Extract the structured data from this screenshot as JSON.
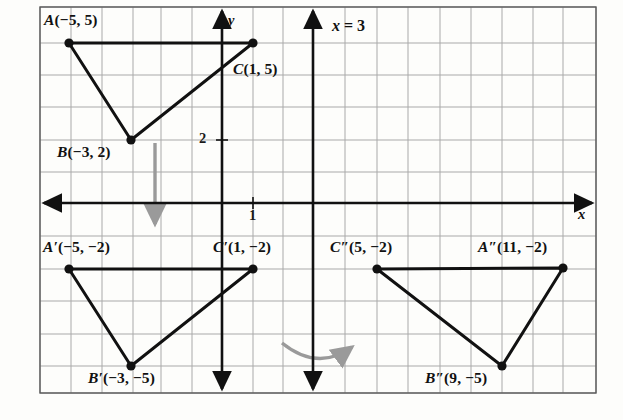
{
  "figure": {
    "grid": {
      "left": 40,
      "top": 7,
      "right": 596,
      "bottom": 393,
      "cell_width": 30.9,
      "cell_height": 32.2,
      "minor_color": "#a9a9a9",
      "border_color": "#4a4a4a"
    },
    "axes": {
      "origin_x": 222,
      "origin_y": 203,
      "x_axis_label": "x",
      "y_axis_label": "y",
      "axis_color": "#111111",
      "y_tick_label": "2",
      "x_tick_label": "1"
    },
    "mirror_line": {
      "label_text": "x = 3",
      "label_var": "x",
      "label_rest": " = 3",
      "x_value": 3
    },
    "shape_color": "#111111",
    "arrow_color": "#9a9a9a"
  },
  "points": [
    {
      "name": "A",
      "label_var": "A",
      "label_coords": "(−5, 5)",
      "x": -5,
      "y": 5,
      "px": 69,
      "py": 43,
      "label_left": 44,
      "label_top": 11,
      "triangle": "pre-image"
    },
    {
      "name": "B",
      "label_var": "B",
      "label_coords": "(−3, 2)",
      "x": -3,
      "y": 2,
      "px": 131,
      "py": 140,
      "label_left": 57,
      "label_top": 143,
      "triangle": "pre-image"
    },
    {
      "name": "C",
      "label_var": "C",
      "label_coords": "(1, 5)",
      "x": 1,
      "y": 5,
      "px": 253,
      "py": 43,
      "label_left": 233,
      "label_top": 60,
      "triangle": "pre-image"
    },
    {
      "name": "A'",
      "label_var": "A′",
      "label_coords": "(−5, −2)",
      "x": -5,
      "y": -2,
      "px": 69,
      "py": 269,
      "label_left": 43,
      "label_top": 238,
      "triangle": "first-image"
    },
    {
      "name": "B'",
      "label_var": "B′",
      "label_coords": "(−3, −5)",
      "x": -3,
      "y": -5,
      "px": 131,
      "py": 366,
      "label_left": 88,
      "label_top": 369,
      "triangle": "first-image"
    },
    {
      "name": "C'",
      "label_var": "C′",
      "label_coords": "(1, −2)",
      "x": 1,
      "y": -2,
      "px": 253,
      "py": 269,
      "label_left": 213,
      "label_top": 238,
      "triangle": "first-image"
    },
    {
      "name": "C''",
      "label_var": "C″",
      "label_coords": "(5, −2)",
      "x": 5,
      "y": -2,
      "px": 377,
      "py": 269,
      "label_left": 330,
      "label_top": 238,
      "triangle": "second-image"
    },
    {
      "name": "B''",
      "label_var": "B″",
      "label_coords": "(9, −5)",
      "x": 9,
      "y": -5,
      "px": 502,
      "py": 366,
      "label_left": 425,
      "label_top": 369,
      "triangle": "second-image"
    },
    {
      "name": "A''",
      "label_var": "A″",
      "label_coords": "(11, −2)",
      "x": 11,
      "y": -2,
      "px": 563,
      "py": 268,
      "label_left": 478,
      "label_top": 238,
      "triangle": "second-image"
    }
  ],
  "triangles": [
    {
      "name": "pre-image",
      "vertices": [
        "A",
        "B",
        "C"
      ],
      "path": "69,43 131,140 253,43 69,43"
    },
    {
      "name": "first-image",
      "vertices": [
        "A'",
        "B'",
        "C'"
      ],
      "path": "69,269 131,366 253,269 69,269"
    },
    {
      "name": "second-image",
      "vertices": [
        "C''",
        "B''",
        "A''"
      ],
      "path": "377,269 502,366 563,268 377,269"
    }
  ],
  "motion_arrows": [
    {
      "name": "reflect-down-arrow",
      "type": "straight",
      "from_x": 155,
      "from_y": 143,
      "to_x": 155,
      "to_y": 228
    },
    {
      "name": "reflect-curve-arrow",
      "type": "curved",
      "start_x": 282,
      "start_y": 344,
      "end_x": 357,
      "end_y": 348
    }
  ]
}
